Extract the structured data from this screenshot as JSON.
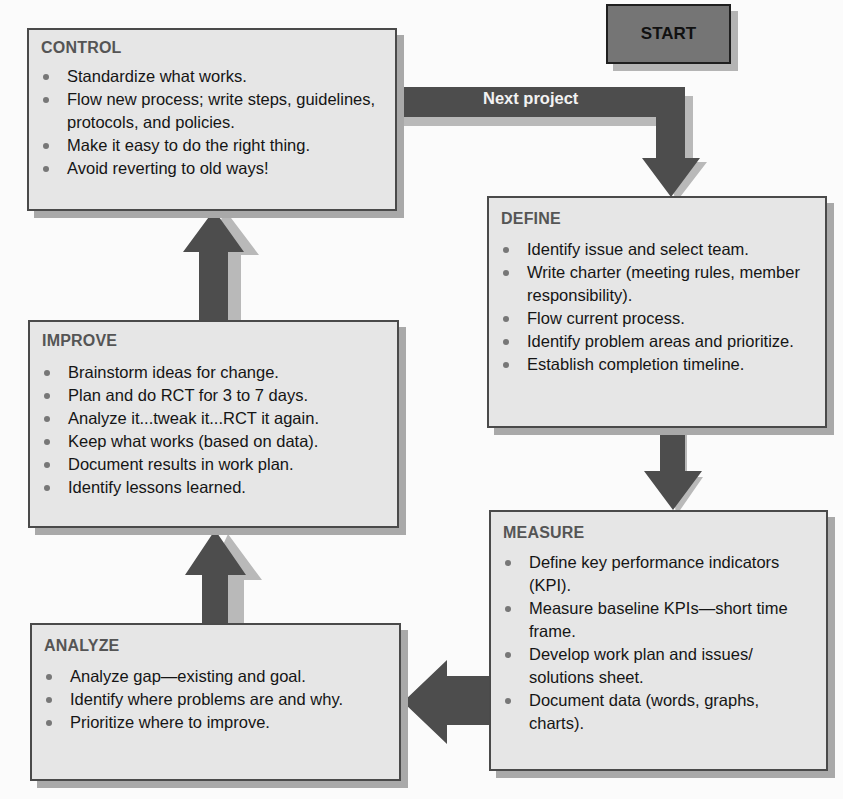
{
  "diagram": {
    "type": "cycle-flowchart",
    "colors": {
      "box_fill": "#e6e6e6",
      "box_border": "#4a4a4a",
      "box_shadow": "#a9a9a9",
      "arrow": "#4d4d4d",
      "start_fill": "#757575",
      "heading_text": "#555555"
    },
    "start": {
      "label": "START"
    },
    "connector": {
      "label": "Next project"
    },
    "steps": [
      {
        "id": "define",
        "title": "DEFINE",
        "items": [
          "Identify issue and select team.",
          "Write charter (meeting rules, member responsibility).",
          "Flow current process.",
          "Identify problem areas and prioritize.",
          "Establish completion timeline."
        ]
      },
      {
        "id": "measure",
        "title": "MEASURE",
        "items": [
          "Define key performance indicators (KPI).",
          "Measure baseline KPIs—short time frame.",
          "Develop work plan and issues/ solutions sheet.",
          "Document data (words, graphs, charts)."
        ]
      },
      {
        "id": "analyze",
        "title": "ANALYZE",
        "items": [
          "Analyze gap—existing and goal.",
          "Identify where problems are and why.",
          "Prioritize where to improve."
        ]
      },
      {
        "id": "improve",
        "title": "IMPROVE",
        "items": [
          "Brainstorm ideas for change.",
          "Plan and do RCT for 3 to 7 days.",
          "Analyze it...tweak it...RCT it again.",
          "Keep what works (based on data).",
          "Document results in work plan.",
          "Identify lessons learned."
        ]
      },
      {
        "id": "control",
        "title": "CONTROL",
        "items": [
          "Standardize what works.",
          "Flow new process; write steps, guidelines, protocols, and policies.",
          "Make it easy to do the right thing.",
          "Avoid reverting to old ways!"
        ]
      }
    ]
  }
}
